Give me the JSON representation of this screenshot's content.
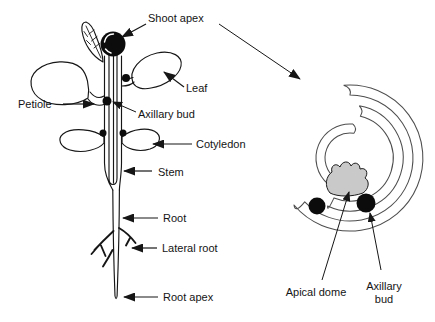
{
  "figure": {
    "background_color": "#ffffff",
    "line_color": "#161616",
    "plant": {
      "labels": {
        "shoot_apex": "Shoot apex",
        "leaf": "Leaf",
        "petiole": "Petiole",
        "axillary_bud": "Axillary bud",
        "cotyledon": "Cotyledon",
        "stem": "Stem",
        "root": "Root",
        "lateral_root": "Lateral root",
        "root_apex": "Root apex"
      }
    },
    "cross_section": {
      "apical_dome_fill": "#c9c9c9",
      "bud_dot_color": "#0c0c0c",
      "labels": {
        "apical_dome": "Apical dome",
        "axillary_bud_line1": "Axillary",
        "axillary_bud_line2": "bud"
      }
    }
  }
}
